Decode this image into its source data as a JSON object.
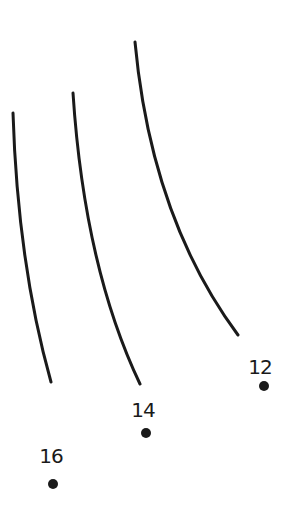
{
  "diagram": {
    "type": "connect-the-dots fragment",
    "stroke_color": "#1a1a1a",
    "curves": [
      {
        "id": "curve-1",
        "path": "M13,113 C16,210 28,300 51,382"
      },
      {
        "id": "curve-2",
        "path": "M73,93 C80,200 100,300 140,384"
      },
      {
        "id": "curve-3",
        "path": "M135,42 C145,150 175,250 238,335"
      }
    ],
    "dots": [
      {
        "label": "12",
        "x": 264,
        "y": 386,
        "label_x": 260,
        "label_y": 367
      },
      {
        "label": "14",
        "x": 146,
        "y": 433,
        "label_x": 143,
        "label_y": 410
      },
      {
        "label": "16",
        "x": 53,
        "y": 484,
        "label_x": 51,
        "label_y": 456
      }
    ]
  }
}
